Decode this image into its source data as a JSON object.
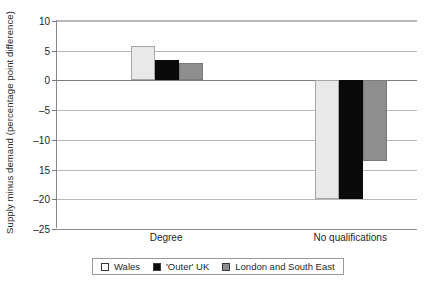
{
  "chart_data": {
    "type": "bar",
    "title": "",
    "xlabel": "",
    "ylabel": "Supply minus demand (percentage point difference)",
    "categories": [
      "Degree",
      "No qualifications"
    ],
    "series": [
      {
        "name": "Wales",
        "color": "#e9e9e9",
        "values": [
          5.8,
          -20.0
        ]
      },
      {
        "name": "'Outer' UK",
        "color": "#0a0a0a",
        "values": [
          3.5,
          -20.0
        ]
      },
      {
        "name": "London and South East",
        "color": "#8e8e8e",
        "values": [
          3.0,
          -13.5
        ]
      }
    ],
    "ylim": [
      -25,
      10
    ],
    "yticks": [
      10,
      5,
      0,
      -5,
      -10,
      -15,
      -20,
      -25
    ],
    "ytick_labels": [
      "10",
      "5",
      "0",
      "–5",
      "–10",
      "15",
      "–20",
      "–25"
    ],
    "grid": true,
    "legend_position": "bottom"
  },
  "legend": {
    "items": [
      {
        "label": "Wales"
      },
      {
        "label": "'Outer' UK"
      },
      {
        "label": "London and South East"
      }
    ]
  }
}
